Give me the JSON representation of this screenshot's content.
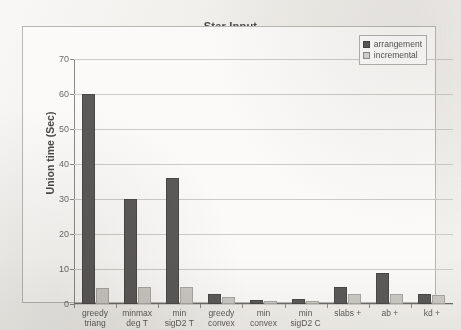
{
  "chart_data": {
    "type": "bar",
    "title": "Star Input",
    "xlabel": "",
    "ylabel": "Union time (Sec)",
    "ylim": [
      0,
      70
    ],
    "ytick_step": 10,
    "yticks": [
      0,
      10,
      20,
      30,
      40,
      50,
      60,
      70
    ],
    "grid": true,
    "legend_position": "top-right",
    "categories": [
      "greedy triang",
      "minmax deg T",
      "min sigD2 T",
      "greedy convex",
      "min convex",
      "min sigD2 C",
      "slabs +",
      "ab +",
      "kd +"
    ],
    "category_lines": [
      [
        "greedy",
        "triang"
      ],
      [
        "minmax",
        "deg T"
      ],
      [
        "min",
        "sigD2 T"
      ],
      [
        "greedy",
        "convex"
      ],
      [
        "min",
        "convex"
      ],
      [
        "min",
        "sigD2 C"
      ],
      [
        "slabs +",
        ""
      ],
      [
        "ab +",
        ""
      ],
      [
        "kd +",
        ""
      ]
    ],
    "series": [
      {
        "name": "arrangement",
        "color": "#5c5a58",
        "values": [
          60,
          30,
          36,
          3,
          1.2,
          1.5,
          5,
          9,
          3
        ]
      },
      {
        "name": "incremental",
        "color": "#cbc9c4",
        "values": [
          4.5,
          5,
          5,
          2,
          1,
          1,
          3,
          3,
          2.5
        ]
      }
    ]
  },
  "legend": {
    "items": [
      {
        "label": "arrangement"
      },
      {
        "label": "incremental"
      }
    ]
  },
  "colors": {
    "series_arrangement": "#5c5a58",
    "series_incremental": "#cbc9c4",
    "plot_background": "#fbfaf8",
    "page_background": "#efeeea",
    "gridline": "#cdcbc6",
    "axis": "#6e6c68",
    "text": "#4a4a4a"
  }
}
